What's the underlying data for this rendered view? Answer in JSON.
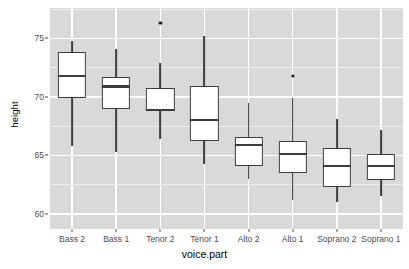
{
  "chart_data": {
    "type": "box",
    "title": "",
    "xlabel": "voice.part",
    "ylabel": "height",
    "ylim": [
      58.7,
      77.6
    ],
    "yticks": [
      60,
      65,
      70,
      75
    ],
    "ytick_labels": [
      "60",
      "65",
      "70",
      "75"
    ],
    "grid": true,
    "legend": "none",
    "categories": [
      "Bass 2",
      "Bass 1",
      "Tenor 2",
      "Tenor 1",
      "Alto 2",
      "Alto 1",
      "Soprano 2",
      "Soprano 1"
    ],
    "boxes": [
      {
        "category": "Bass 2",
        "lower_whisker": 65.8,
        "q1": 69.9,
        "median": 71.8,
        "q3": 73.8,
        "upper_whisker": 74.8,
        "outliers": []
      },
      {
        "category": "Bass 1",
        "lower_whisker": 65.3,
        "q1": 69.0,
        "median": 70.9,
        "q3": 71.7,
        "upper_whisker": 74.1,
        "outliers": []
      },
      {
        "category": "Tenor 2",
        "lower_whisker": 66.4,
        "q1": 68.8,
        "median": 68.9,
        "q3": 70.8,
        "upper_whisker": 72.9,
        "outliers": [
          76.3
        ]
      },
      {
        "category": "Tenor 1",
        "lower_whisker": 64.3,
        "q1": 66.2,
        "median": 68.0,
        "q3": 70.9,
        "upper_whisker": 75.2,
        "outliers": []
      },
      {
        "category": "Alto 2",
        "lower_whisker": 63.0,
        "q1": 64.1,
        "median": 65.9,
        "q3": 66.6,
        "upper_whisker": 69.5,
        "outliers": []
      },
      {
        "category": "Alto 1",
        "lower_whisker": 61.2,
        "q1": 63.5,
        "median": 65.1,
        "q3": 66.2,
        "upper_whisker": 69.9,
        "outliers": [
          71.8
        ]
      },
      {
        "category": "Soprano 2",
        "lower_whisker": 61.0,
        "q1": 62.3,
        "median": 64.1,
        "q3": 65.6,
        "upper_whisker": 68.1,
        "outliers": []
      },
      {
        "category": "Soprano 1",
        "lower_whisker": 61.5,
        "q1": 62.9,
        "median": 64.1,
        "q3": 65.1,
        "upper_whisker": 67.2,
        "outliers": []
      }
    ],
    "colors": {
      "panel_background": "#D9D9D9",
      "grid_line": "#FFFFFF",
      "box_outline": "#3D3D3D",
      "box_fill": "#FFFFFF",
      "outlier": "#1A1A1A",
      "tick_text": "#4D4D4D",
      "axis_title_text": "#000000",
      "page_background": "#FFFFFF"
    }
  }
}
